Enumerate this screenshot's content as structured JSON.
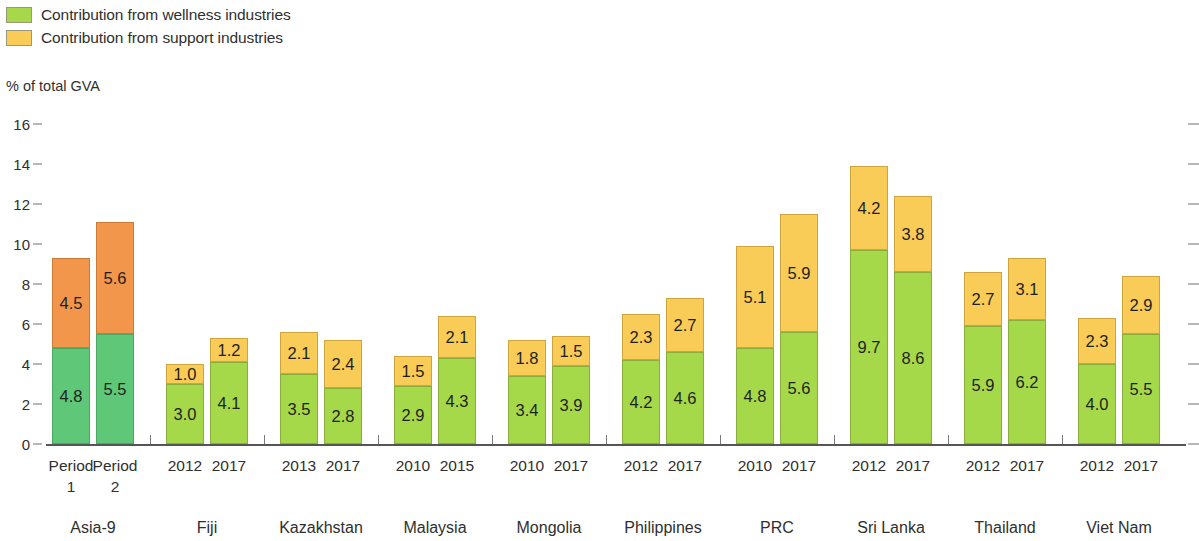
{
  "legend": {
    "items": [
      {
        "label": "Contribution from wellness industries",
        "color": "#a5d94a",
        "key": "wellness"
      },
      {
        "label": "Contribution from support industries",
        "color": "#f9cb57",
        "key": "support"
      }
    ]
  },
  "axis_title": "% of total GVA",
  "chart_data": {
    "type": "bar",
    "subtype": "stacked",
    "title": "",
    "xlabel": "",
    "ylabel": "% of total GVA",
    "ylim": [
      0,
      16
    ],
    "yticks": [
      0,
      2,
      4,
      6,
      8,
      10,
      12,
      14,
      16
    ],
    "ytick_labels": [
      "0",
      "2",
      "4",
      "6",
      "8",
      "10",
      "12",
      "14",
      "16"
    ],
    "grid": false,
    "legend_position": "top-left",
    "right_axis_ticks_unlabeled": true,
    "series": [
      {
        "name": "Contribution from wellness industries",
        "color": "#a5d94a",
        "highlight_color": "#5ec878"
      },
      {
        "name": "Contribution from support industries",
        "color": "#f9cb57",
        "highlight_color": "#f2964c"
      }
    ],
    "groups": [
      {
        "name": "Asia-9",
        "highlight": true,
        "bars": [
          {
            "label": "Period\n1",
            "wellness": 4.8,
            "support": 4.5,
            "total": 9.3
          },
          {
            "label": "Period\n2",
            "wellness": 5.5,
            "support": 5.6,
            "total": 11.1
          }
        ]
      },
      {
        "name": "Fiji",
        "highlight": false,
        "bars": [
          {
            "label": "2012",
            "wellness": 3.0,
            "support": 1.0,
            "total": 4.0
          },
          {
            "label": "2017",
            "wellness": 4.1,
            "support": 1.2,
            "total": 5.3
          }
        ]
      },
      {
        "name": "Kazakhstan",
        "highlight": false,
        "bars": [
          {
            "label": "2013",
            "wellness": 3.5,
            "support": 2.1,
            "total": 5.6
          },
          {
            "label": "2017",
            "wellness": 2.8,
            "support": 2.4,
            "total": 5.2
          }
        ]
      },
      {
        "name": "Malaysia",
        "highlight": false,
        "bars": [
          {
            "label": "2010",
            "wellness": 2.9,
            "support": 1.5,
            "total": 4.4
          },
          {
            "label": "2015",
            "wellness": 4.3,
            "support": 2.1,
            "total": 6.4
          }
        ]
      },
      {
        "name": "Mongolia",
        "highlight": false,
        "bars": [
          {
            "label": "2010",
            "wellness": 3.4,
            "support": 1.8,
            "total": 5.2
          },
          {
            "label": "2017",
            "wellness": 3.9,
            "support": 1.5,
            "total": 5.4
          }
        ]
      },
      {
        "name": "Philippines",
        "highlight": false,
        "bars": [
          {
            "label": "2012",
            "wellness": 4.2,
            "support": 2.3,
            "total": 6.5
          },
          {
            "label": "2017",
            "wellness": 4.6,
            "support": 2.7,
            "total": 7.3
          }
        ]
      },
      {
        "name": "PRC",
        "highlight": false,
        "bars": [
          {
            "label": "2010",
            "wellness": 4.8,
            "support": 5.1,
            "total": 9.9
          },
          {
            "label": "2017",
            "wellness": 5.6,
            "support": 5.9,
            "total": 11.5
          }
        ]
      },
      {
        "name": "Sri Lanka",
        "highlight": false,
        "bars": [
          {
            "label": "2012",
            "wellness": 9.7,
            "support": 4.2,
            "total": 13.9
          },
          {
            "label": "2017",
            "wellness": 8.6,
            "support": 3.8,
            "total": 12.4
          }
        ]
      },
      {
        "name": "Thailand",
        "highlight": false,
        "bars": [
          {
            "label": "2012",
            "wellness": 5.9,
            "support": 2.7,
            "total": 8.6
          },
          {
            "label": "2017",
            "wellness": 6.2,
            "support": 3.1,
            "total": 9.3
          }
        ]
      },
      {
        "name": "Viet Nam",
        "highlight": false,
        "bars": [
          {
            "label": "2012",
            "wellness": 4.0,
            "support": 2.3,
            "total": 6.3
          },
          {
            "label": "2017",
            "wellness": 5.5,
            "support": 2.9,
            "total": 8.4
          }
        ]
      }
    ]
  },
  "geometry": {
    "baseline_y": 444,
    "px_per_unit": 20,
    "plot_left": 46,
    "plot_right": 1186,
    "bar_width": 38,
    "pair_gap": 6,
    "group_gap": 32,
    "group_start_x": 52
  }
}
